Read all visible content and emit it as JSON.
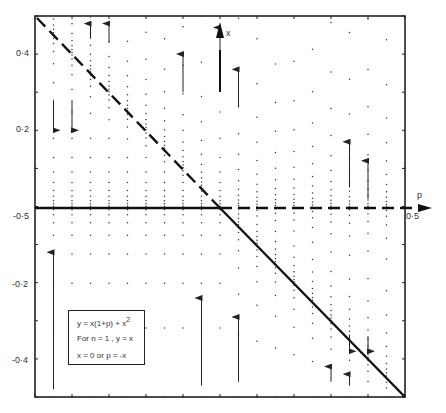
{
  "chart_data": {
    "type": "line",
    "title": "",
    "xlabel": "p",
    "ylabel": "x",
    "xlim": [
      -0.5,
      0.5
    ],
    "ylim": [
      -0.5,
      0.5
    ],
    "x_tick_labels": [
      {
        "value": -0.5,
        "label": "-0·5"
      },
      {
        "value": 0.5,
        "label": "0·5"
      }
    ],
    "y_tick_labels": [
      {
        "value": 0.4,
        "label": "0·4"
      },
      {
        "value": 0.2,
        "label": "0·2"
      },
      {
        "value": -0.2,
        "label": "-0·2"
      },
      {
        "value": -0.4,
        "label": "-0·4"
      }
    ],
    "grid": false,
    "series": [
      {
        "name": "x = 0 (stable, p < 0)",
        "style": "solid",
        "points": [
          [
            -0.5,
            0
          ],
          [
            0,
            0
          ]
        ]
      },
      {
        "name": "x = 0 (unstable, p > 0)",
        "style": "dashed",
        "points": [
          [
            0,
            0
          ],
          [
            0.5,
            0
          ]
        ]
      },
      {
        "name": "p = -x (unstable, p < 0)",
        "style": "dashed",
        "points": [
          [
            -0.5,
            0.5
          ],
          [
            0,
            0
          ]
        ]
      },
      {
        "name": "p = -x (stable, p > 0)",
        "style": "solid",
        "points": [
          [
            0,
            0
          ],
          [
            0.5,
            -0.5
          ]
        ]
      }
    ],
    "flow_columns_p": [
      -0.45,
      -0.4,
      -0.35,
      -0.3,
      -0.25,
      -0.2,
      -0.15,
      -0.1,
      -0.05,
      0,
      0.05,
      0.1,
      0.15,
      0.2,
      0.25,
      0.3,
      0.35,
      0.4,
      0.45
    ],
    "arrows": [
      {
        "p": -0.45,
        "x_from": -0.48,
        "x_to": -0.12,
        "dir": "up"
      },
      {
        "p": -0.45,
        "x_from": 0.28,
        "x_to": 0.2,
        "dir": "down"
      },
      {
        "p": -0.4,
        "x_from": 0.28,
        "x_to": 0.2,
        "dir": "down"
      },
      {
        "p": -0.35,
        "x_from": 0.44,
        "x_to": 0.48,
        "dir": "up"
      },
      {
        "p": -0.3,
        "x_from": 0.43,
        "x_to": 0.48,
        "dir": "up"
      },
      {
        "p": -0.1,
        "x_from": 0.3,
        "x_to": 0.4,
        "dir": "up"
      },
      {
        "p": 0,
        "x_from": 0.4,
        "x_to": 0.47,
        "dir": "up"
      },
      {
        "p": 0.05,
        "x_from": 0.26,
        "x_to": 0.36,
        "dir": "up"
      },
      {
        "p": -0.05,
        "x_from": -0.47,
        "x_to": -0.24,
        "dir": "up"
      },
      {
        "p": 0.05,
        "x_from": -0.46,
        "x_to": -0.29,
        "dir": "up"
      },
      {
        "p": 0.35,
        "x_from": 0.05,
        "x_to": 0.17,
        "dir": "up"
      },
      {
        "p": 0.4,
        "x_from": 0.02,
        "x_to": 0.12,
        "dir": "up"
      },
      {
        "p": 0.35,
        "x_from": -0.34,
        "x_to": -0.38,
        "dir": "down"
      },
      {
        "p": 0.4,
        "x_from": -0.34,
        "x_to": -0.38,
        "dir": "down"
      },
      {
        "p": 0.3,
        "x_from": -0.46,
        "x_to": -0.42,
        "dir": "up"
      },
      {
        "p": 0.35,
        "x_from": -0.47,
        "x_to": -0.44,
        "dir": "up"
      }
    ],
    "annotations": [
      "y = x(1+p) + x²",
      "For n = 1 , y = x",
      "x = 0  or  p = -x"
    ]
  },
  "axes": {
    "p_label": "p",
    "x_label": "x",
    "p_min_label": "-0·5",
    "p_max_label": "0·5",
    "y_labels": [
      "0·4",
      "0·2",
      "-0·2",
      "-0·4"
    ]
  },
  "legend": {
    "line1": "y = x(1+p) + x",
    "line1_sup": "2",
    "line2": "For  n = 1 , y = x",
    "line3": "x = 0   or   p = -x"
  }
}
